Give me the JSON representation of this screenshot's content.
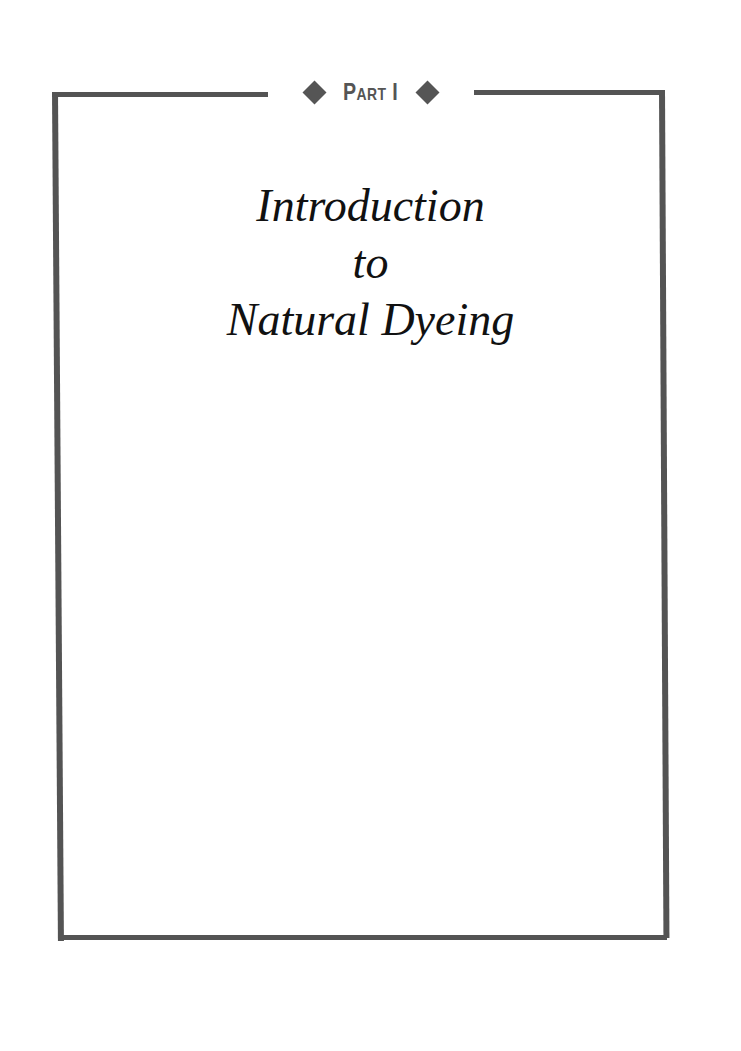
{
  "header": {
    "label": "Part I",
    "ornament_left": "diamond-icon",
    "ornament_right": "diamond-icon"
  },
  "title": {
    "line1": "Introduction",
    "line2": "to",
    "line3": "Natural Dyeing"
  },
  "colors": {
    "frame": "#545454",
    "text": "#111111",
    "background": "#ffffff"
  }
}
